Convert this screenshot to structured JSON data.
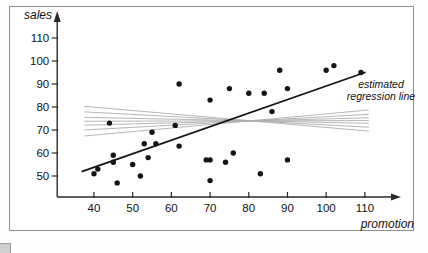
{
  "figure": {
    "y_axis_label": "sales",
    "x_axis_label": "promotion",
    "annotation": {
      "line1": "estimated",
      "line2": "regression line"
    }
  },
  "colors": {
    "dot": "#141414",
    "regression_line": "#141414",
    "fan_line": "#adadad",
    "axis": "#2a2a2a",
    "tick_text": "#111111",
    "figure_border": "#8f8f8f"
  },
  "chart_data": {
    "type": "scatter",
    "title": "",
    "xlabel": "promotion",
    "ylabel": "sales",
    "x_ticks": [
      40,
      50,
      60,
      70,
      80,
      90,
      100,
      110
    ],
    "y_ticks": [
      50,
      60,
      70,
      80,
      90,
      100,
      110
    ],
    "xlim": [
      30.5,
      116
    ],
    "ylim": [
      41,
      118
    ],
    "grid": false,
    "points": [
      [
        40,
        51
      ],
      [
        41,
        53
      ],
      [
        44,
        73
      ],
      [
        45,
        56
      ],
      [
        45,
        59
      ],
      [
        46,
        47
      ],
      [
        50,
        55
      ],
      [
        52,
        50
      ],
      [
        53,
        64
      ],
      [
        54,
        58
      ],
      [
        55,
        69
      ],
      [
        56,
        64
      ],
      [
        61,
        72
      ],
      [
        62,
        63
      ],
      [
        62,
        90
      ],
      [
        69,
        57
      ],
      [
        70,
        57
      ],
      [
        70,
        48
      ],
      [
        70,
        83
      ],
      [
        74,
        56
      ],
      [
        75,
        88
      ],
      [
        76,
        60
      ],
      [
        80,
        86
      ],
      [
        83,
        51
      ],
      [
        84,
        86
      ],
      [
        86,
        78
      ],
      [
        88,
        96
      ],
      [
        90,
        88
      ],
      [
        90,
        57
      ],
      [
        100,
        96
      ],
      [
        102,
        98
      ],
      [
        109,
        95
      ]
    ],
    "regression_line": {
      "label": "estimated regression line",
      "x1": 37,
      "y1": 52,
      "x2": 110,
      "y2": 95
    },
    "fan_lines": {
      "description": "candidate lines crossing near pivot",
      "pivot": [
        80.5,
        74
      ],
      "x_start": 37.5,
      "x_end": 111,
      "start_sales": [
        80.3,
        77.9,
        75.5,
        73.8,
        72.1,
        70.0,
        67.4
      ],
      "end_sales": [
        69.5,
        71.2,
        72.9,
        74.1,
        75.3,
        76.8,
        78.7
      ]
    }
  }
}
